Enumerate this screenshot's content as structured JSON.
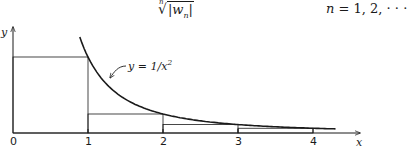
{
  "header": {
    "formula_root_index": "n",
    "formula_root_body": "|w",
    "formula_root_sub": "n",
    "formula_root_close": "|",
    "formula_n_var": "n",
    "formula_n_values": " = 1, 2, · · ·"
  },
  "chart_data": {
    "type": "line",
    "title": "",
    "xlabel": "x",
    "ylabel": "y",
    "xlim": [
      0,
      4.6
    ],
    "ylim": [
      0,
      1.4
    ],
    "x_ticks": [
      0,
      1,
      2,
      3,
      4
    ],
    "x_tick_labels": [
      "0",
      "1",
      "2",
      "3",
      "4"
    ],
    "grid": false,
    "series": [
      {
        "name": "y = 1/x^2",
        "function": "1/x^2",
        "x_range": [
          0.89,
          4.3
        ]
      }
    ],
    "rectangles": [
      {
        "x0": 0,
        "x1": 1,
        "height": 1
      },
      {
        "x0": 1,
        "x1": 2,
        "height": 0.25
      },
      {
        "x0": 2,
        "x1": 3,
        "height": 0.1111
      },
      {
        "x0": 3,
        "x1": 4,
        "height": 0.0625
      }
    ],
    "annotations": [
      {
        "text": "y = 1/x",
        "superscript": "2",
        "points_to_x": 1.3
      }
    ]
  }
}
